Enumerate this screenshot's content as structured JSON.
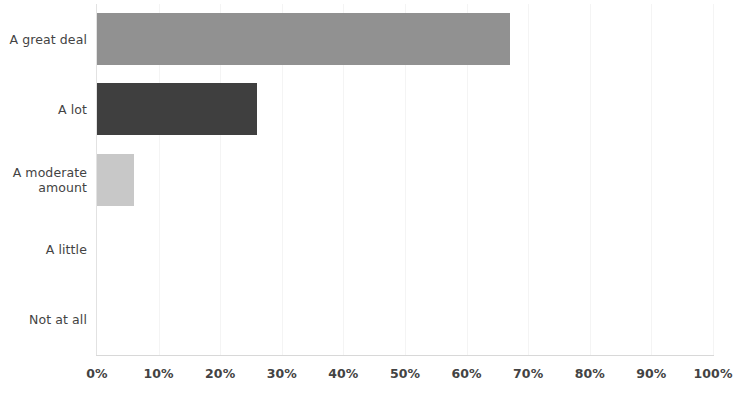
{
  "chart_data": {
    "type": "bar",
    "orientation": "horizontal",
    "title": "",
    "xlabel": "",
    "ylabel": "",
    "categories": [
      "A great deal",
      "A lot",
      "A moderate amount",
      "A little",
      "Not at all"
    ],
    "values": [
      67,
      26,
      6,
      0,
      0
    ],
    "value_suffix": "%",
    "xlim": [
      0,
      100
    ],
    "xticks": [
      0,
      10,
      20,
      30,
      40,
      50,
      60,
      70,
      80,
      90,
      100
    ],
    "xtick_labels": [
      "0%",
      "10%",
      "20%",
      "30%",
      "40%",
      "50%",
      "60%",
      "70%",
      "80%",
      "90%",
      "100%"
    ],
    "grid": true,
    "grid_axis": "x",
    "legend": false,
    "bar_colors": [
      "#919191",
      "#3f3f3f",
      "#c8c8c8",
      "#b0b0b0",
      "#b0b0b0"
    ],
    "series": [
      {
        "name": "Share of respondents",
        "values": [
          67,
          26,
          6,
          0,
          0
        ]
      }
    ]
  },
  "axis": {
    "line_color": "#dcdcdc",
    "grid_color": "#f4f4f4",
    "label_color": "#434343"
  },
  "rows": [
    {
      "label_line1": "A great deal",
      "label_line2": ""
    },
    {
      "label_line1": "A lot",
      "label_line2": ""
    },
    {
      "label_line1": "A moderate",
      "label_line2": "amount"
    },
    {
      "label_line1": "A little",
      "label_line2": ""
    },
    {
      "label_line1": "Not at all",
      "label_line2": ""
    }
  ]
}
